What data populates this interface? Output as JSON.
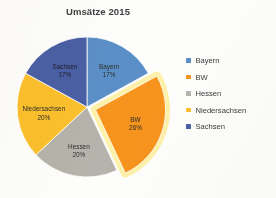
{
  "chart_data": {
    "type": "pie",
    "title": "Umsätze 2015",
    "xlabel": "",
    "ylabel": "",
    "legend_position": "right",
    "grid": false,
    "start_angle_deg": 0,
    "direction": "clockwise",
    "value_unit": "percent",
    "categories": [
      "Bayern",
      "BW",
      "Hessen",
      "Niedersachsen",
      "Sachsen"
    ],
    "values": [
      17,
      26,
      20,
      20,
      17
    ],
    "colors": [
      "#5b8fc7",
      "#f7941e",
      "#b5b3ab",
      "#fbc02d",
      "#4a5fa5"
    ],
    "exploded": [
      "BW"
    ],
    "highlight_color": "#fdf0a8",
    "slices": [
      {
        "label": "Bayern",
        "value": 17,
        "display_value": "17%",
        "color": "#5b8fc7",
        "exploded": false,
        "label_text": "Bayern",
        "label_value": "17%"
      },
      {
        "label": "BW",
        "value": 26,
        "display_value": "26%",
        "color": "#f7941e",
        "exploded": true,
        "label_text": "BW",
        "label_value": "26%"
      },
      {
        "label": "Hessen",
        "value": 20,
        "display_value": "20%",
        "color": "#b5b3ab",
        "exploded": false,
        "label_text": "Hessen",
        "label_value": "20%"
      },
      {
        "label": "Niedersachsen",
        "value": 20,
        "display_value": "20%",
        "color": "#fbc02d",
        "exploded": false,
        "label_text": "Niedersachsen",
        "label_value": "20%"
      },
      {
        "label": "Sachsen",
        "value": 17,
        "display_value": "17%",
        "color": "#4a5fa5",
        "exploded": false,
        "label_text": "Sachsen",
        "label_value": "17%"
      }
    ]
  },
  "legend": {
    "items": [
      {
        "label": "Bayern",
        "color": "#5b8fc7"
      },
      {
        "label": "BW",
        "color": "#f7941e"
      },
      {
        "label": "Hessen",
        "color": "#b5b3ab"
      },
      {
        "label": "Niedersachsen",
        "color": "#fbc02d"
      },
      {
        "label": "Sachsen",
        "color": "#4a5fa5"
      }
    ]
  }
}
